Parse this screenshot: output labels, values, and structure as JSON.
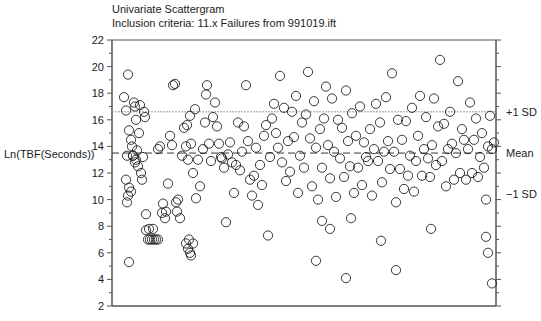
{
  "chart_data": {
    "type": "scatter",
    "title": "Univariate Scattergram",
    "subtitle": "Inclusion criteria: 11.x Failures from 991019.ift",
    "xlabel": "",
    "ylabel": "Ln(TBF(Seconds))",
    "ylim": [
      2,
      22
    ],
    "yticks": [
      2,
      4,
      6,
      8,
      10,
      12,
      14,
      16,
      18,
      20,
      22
    ],
    "grid": false,
    "marker": "open-circle",
    "reference_lines": [
      {
        "label": "+1 SD",
        "value": 16.6,
        "style": "dotted",
        "color": "#999999"
      },
      {
        "label": "Mean",
        "value": 13.5,
        "style": "dashed",
        "color": "#333333"
      },
      {
        "label": "-1 SD",
        "value": 10.4,
        "style": "none"
      }
    ],
    "points_x_pixel_y_value": [
      [
        124,
        17.7
      ],
      [
        126,
        16.7
      ],
      [
        127,
        13.3
      ],
      [
        128,
        19.4
      ],
      [
        129,
        15.2
      ],
      [
        131,
        14.5
      ],
      [
        132,
        14.0
      ],
      [
        133,
        13.3
      ],
      [
        134,
        17.3
      ],
      [
        135,
        17.0
      ],
      [
        136,
        16.0
      ],
      [
        137,
        13.7
      ],
      [
        138,
        12.5
      ],
      [
        139,
        15.0
      ],
      [
        140,
        17.1
      ],
      [
        141,
        12.0
      ],
      [
        142,
        11.5
      ],
      [
        143,
        13.2
      ],
      [
        144,
        16.6
      ],
      [
        145,
        16.2
      ],
      [
        126,
        11.5
      ],
      [
        128,
        10.3
      ],
      [
        129,
        10.9
      ],
      [
        131,
        10.6
      ],
      [
        127,
        9.8
      ],
      [
        133,
        13.3
      ],
      [
        135,
        12.8
      ],
      [
        136,
        13.0
      ],
      [
        129,
        5.3
      ],
      [
        146,
        8.9
      ],
      [
        146,
        7.7
      ],
      [
        148,
        7.0
      ],
      [
        150,
        7.0
      ],
      [
        152,
        7.0
      ],
      [
        154,
        7.0
      ],
      [
        156,
        7.0
      ],
      [
        158,
        7.0
      ],
      [
        149,
        7.8
      ],
      [
        153,
        7.8
      ],
      [
        158,
        13.8
      ],
      [
        160,
        14.0
      ],
      [
        162,
        9.0
      ],
      [
        163,
        9.7
      ],
      [
        165,
        8.6
      ],
      [
        166,
        9.1
      ],
      [
        168,
        11.2
      ],
      [
        170,
        14.8
      ],
      [
        172,
        14.1
      ],
      [
        173,
        18.6
      ],
      [
        175,
        18.7
      ],
      [
        176,
        9.8
      ],
      [
        177,
        9.1
      ],
      [
        178,
        10.0
      ],
      [
        180,
        8.6
      ],
      [
        182,
        13.3
      ],
      [
        184,
        15.4
      ],
      [
        186,
        14.0
      ],
      [
        187,
        15.6
      ],
      [
        188,
        13.0
      ],
      [
        190,
        16.3
      ],
      [
        191,
        14.2
      ],
      [
        193,
        12.0
      ],
      [
        195,
        16.8
      ],
      [
        196,
        10.1
      ],
      [
        198,
        13.0
      ],
      [
        200,
        11.0
      ],
      [
        186,
        6.7
      ],
      [
        188,
        6.3
      ],
      [
        190,
        6.0
      ],
      [
        191,
        5.8
      ],
      [
        189,
        7.0
      ],
      [
        193,
        6.7
      ],
      [
        203,
        13.8
      ],
      [
        205,
        15.8
      ],
      [
        206,
        17.9
      ],
      [
        207,
        18.6
      ],
      [
        209,
        14.2
      ],
      [
        211,
        12.9
      ],
      [
        213,
        16.2
      ],
      [
        215,
        17.3
      ],
      [
        217,
        15.5
      ],
      [
        219,
        14.2
      ],
      [
        221,
        13.2
      ],
      [
        222,
        13.1
      ],
      [
        224,
        12.4
      ],
      [
        226,
        8.3
      ],
      [
        228,
        13.4
      ],
      [
        230,
        14.3
      ],
      [
        232,
        12.8
      ],
      [
        234,
        10.5
      ],
      [
        236,
        12.6
      ],
      [
        238,
        15.8
      ],
      [
        240,
        12.2
      ],
      [
        242,
        13.6
      ],
      [
        244,
        15.5
      ],
      [
        246,
        18.6
      ],
      [
        248,
        14.4
      ],
      [
        250,
        11.5
      ],
      [
        252,
        10.3
      ],
      [
        254,
        11.8
      ],
      [
        256,
        13.9
      ],
      [
        258,
        9.6
      ],
      [
        260,
        12.6
      ],
      [
        262,
        11.1
      ],
      [
        264,
        14.8
      ],
      [
        266,
        15.6
      ],
      [
        268,
        7.3
      ],
      [
        270,
        13.2
      ],
      [
        272,
        16.1
      ],
      [
        274,
        17.2
      ],
      [
        276,
        15.0
      ],
      [
        278,
        13.9
      ],
      [
        280,
        19.3
      ],
      [
        282,
        12.8
      ],
      [
        284,
        16.9
      ],
      [
        286,
        11.4
      ],
      [
        288,
        14.4
      ],
      [
        290,
        12.1
      ],
      [
        292,
        16.6
      ],
      [
        294,
        14.7
      ],
      [
        296,
        17.8
      ],
      [
        298,
        10.5
      ],
      [
        300,
        13.3
      ],
      [
        302,
        15.8
      ],
      [
        304,
        12.4
      ],
      [
        306,
        16.4
      ],
      [
        308,
        19.6
      ],
      [
        310,
        14.6
      ],
      [
        312,
        11.0
      ],
      [
        314,
        17.4
      ],
      [
        316,
        13.9
      ],
      [
        318,
        10.0
      ],
      [
        320,
        15.3
      ],
      [
        322,
        12.4
      ],
      [
        324,
        16.1
      ],
      [
        326,
        18.5
      ],
      [
        328,
        14.1
      ],
      [
        330,
        11.6
      ],
      [
        332,
        17.6
      ],
      [
        334,
        13.6
      ],
      [
        336,
        10.2
      ],
      [
        338,
        16.0
      ],
      [
        340,
        13.1
      ],
      [
        342,
        15.4
      ],
      [
        344,
        11.7
      ],
      [
        346,
        18.2
      ],
      [
        348,
        14.4
      ],
      [
        350,
        12.5
      ],
      [
        352,
        16.5
      ],
      [
        354,
        10.5
      ],
      [
        356,
        14.8
      ],
      [
        358,
        12.4
      ],
      [
        360,
        17.0
      ],
      [
        362,
        11.1
      ],
      [
        364,
        14.3
      ],
      [
        366,
        13.2
      ],
      [
        368,
        12.9
      ],
      [
        316,
        5.4
      ],
      [
        322,
        8.4
      ],
      [
        330,
        7.8
      ],
      [
        346,
        4.1
      ],
      [
        351,
        8.6
      ],
      [
        370,
        15.3
      ],
      [
        372,
        10.3
      ],
      [
        374,
        13.8
      ],
      [
        376,
        17.2
      ],
      [
        378,
        12.9
      ],
      [
        380,
        15.8
      ],
      [
        382,
        11.3
      ],
      [
        384,
        13.6
      ],
      [
        386,
        17.7
      ],
      [
        388,
        14.4
      ],
      [
        390,
        12.3
      ],
      [
        392,
        19.5
      ],
      [
        394,
        13.6
      ],
      [
        396,
        9.8
      ],
      [
        398,
        16.0
      ],
      [
        400,
        12.3
      ],
      [
        402,
        14.5
      ],
      [
        404,
        10.8
      ],
      [
        406,
        15.9
      ],
      [
        408,
        11.8
      ],
      [
        410,
        13.3
      ],
      [
        412,
        16.9
      ],
      [
        414,
        10.6
      ],
      [
        416,
        12.9
      ],
      [
        418,
        14.8
      ],
      [
        420,
        17.8
      ],
      [
        422,
        11.8
      ],
      [
        424,
        13.8
      ],
      [
        426,
        16.2
      ],
      [
        428,
        13.1
      ],
      [
        430,
        11.7
      ],
      [
        432,
        14.1
      ],
      [
        434,
        17.6
      ],
      [
        436,
        12.6
      ],
      [
        438,
        15.5
      ],
      [
        440,
        20.5
      ],
      [
        442,
        12.9
      ],
      [
        444,
        15.7
      ],
      [
        446,
        11.0
      ],
      [
        448,
        13.8
      ],
      [
        450,
        16.6
      ],
      [
        452,
        14.2
      ],
      [
        454,
        11.5
      ],
      [
        456,
        13.5
      ],
      [
        458,
        18.9
      ],
      [
        460,
        12.0
      ],
      [
        462,
        15.3
      ],
      [
        464,
        14.5
      ],
      [
        466,
        11.5
      ],
      [
        468,
        13.8
      ],
      [
        470,
        17.3
      ],
      [
        472,
        12.0
      ],
      [
        474,
        14.5
      ],
      [
        476,
        16.1
      ],
      [
        478,
        11.7
      ],
      [
        480,
        13.2
      ],
      [
        482,
        15.0
      ],
      [
        484,
        12.4
      ],
      [
        486,
        10.0
      ],
      [
        488,
        14.0
      ],
      [
        490,
        16.3
      ],
      [
        492,
        13.8
      ],
      [
        494,
        14.3
      ],
      [
        381,
        6.9
      ],
      [
        396,
        4.7
      ],
      [
        431,
        7.8
      ],
      [
        486,
        7.2
      ],
      [
        488,
        6.0
      ],
      [
        492,
        3.7
      ]
    ]
  },
  "labels": {
    "title": "Univariate Scattergram",
    "subtitle": "Inclusion criteria: 11.x Failures from 991019.ift",
    "ylabel": "Ln(TBF(Seconds))",
    "plus_sd": "+1 SD",
    "mean": "Mean",
    "minus_sd": "−1 SD"
  }
}
